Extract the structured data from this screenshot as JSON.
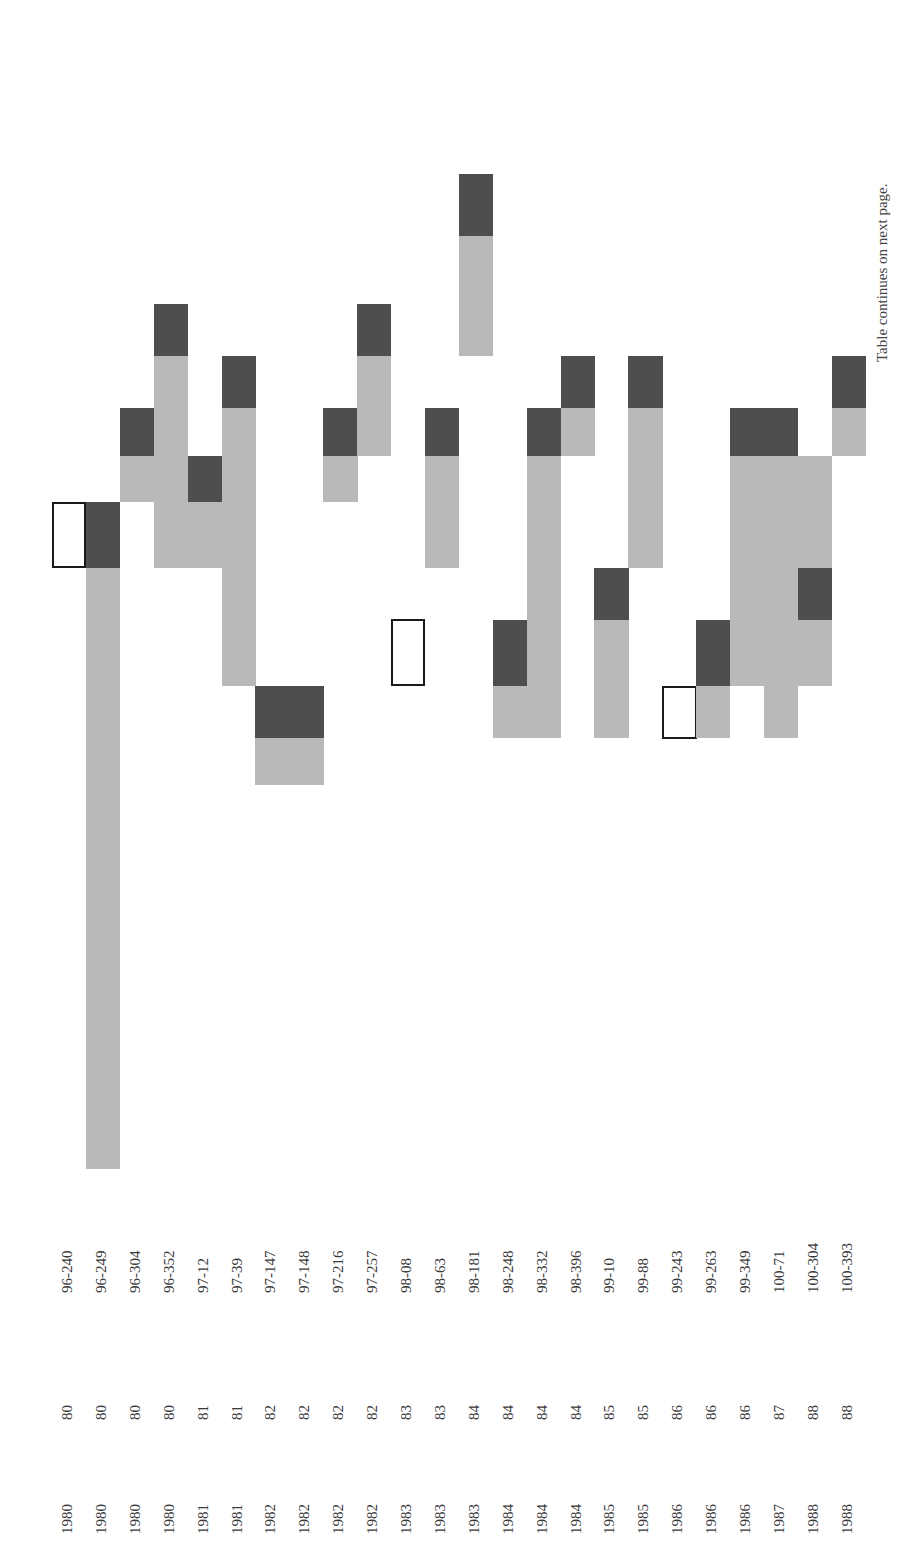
{
  "footnote": "Table continues on next page.",
  "colors": {
    "light": "#b9b9b9",
    "dark": "#4e4e4e",
    "outline": "#1a1a1a"
  },
  "rows": [
    {
      "year": "1980",
      "vol": "80",
      "cite": "96-240"
    },
    {
      "year": "1980",
      "vol": "80",
      "cite": "96-249"
    },
    {
      "year": "1980",
      "vol": "80",
      "cite": "96-304"
    },
    {
      "year": "1980",
      "vol": "80",
      "cite": "96-352"
    },
    {
      "year": "1981",
      "vol": "81",
      "cite": "97-12"
    },
    {
      "year": "1981",
      "vol": "81",
      "cite": "97-39"
    },
    {
      "year": "1982",
      "vol": "82",
      "cite": "97-147"
    },
    {
      "year": "1982",
      "vol": "82",
      "cite": "97-148"
    },
    {
      "year": "1982",
      "vol": "82",
      "cite": "97-216"
    },
    {
      "year": "1982",
      "vol": "82",
      "cite": "97-257"
    },
    {
      "year": "1983",
      "vol": "83",
      "cite": "98-08"
    },
    {
      "year": "1983",
      "vol": "83",
      "cite": "98-63"
    },
    {
      "year": "1983",
      "vol": "84",
      "cite": "98-181"
    },
    {
      "year": "1984",
      "vol": "84",
      "cite": "98-248"
    },
    {
      "year": "1984",
      "vol": "84",
      "cite": "98-332"
    },
    {
      "year": "1984",
      "vol": "84",
      "cite": "98-396"
    },
    {
      "year": "1985",
      "vol": "85",
      "cite": "99-10"
    },
    {
      "year": "1985",
      "vol": "85",
      "cite": "99-88"
    },
    {
      "year": "1986",
      "vol": "86",
      "cite": "99-243"
    },
    {
      "year": "1986",
      "vol": "86",
      "cite": "99-263"
    },
    {
      "year": "1986",
      "vol": "86",
      "cite": "99-349"
    },
    {
      "year": "1987",
      "vol": "87",
      "cite": "100-71"
    },
    {
      "year": "1988",
      "vol": "88",
      "cite": "100-304"
    },
    {
      "year": "1988",
      "vol": "88",
      "cite": "100-393"
    }
  ],
  "segments": [
    {
      "col": 0,
      "top": 502,
      "bottom": 568,
      "type": "outline"
    },
    {
      "col": 1,
      "top": 502,
      "bottom": 568,
      "type": "dark"
    },
    {
      "col": 1,
      "top": 568,
      "bottom": 1169,
      "type": "light"
    },
    {
      "col": 2,
      "top": 408,
      "bottom": 456,
      "type": "dark"
    },
    {
      "col": 2,
      "top": 456,
      "bottom": 502,
      "type": "light"
    },
    {
      "col": 3,
      "top": 304,
      "bottom": 356,
      "type": "dark"
    },
    {
      "col": 3,
      "top": 356,
      "bottom": 568,
      "type": "light"
    },
    {
      "col": 4,
      "top": 456,
      "bottom": 502,
      "type": "dark"
    },
    {
      "col": 4,
      "top": 502,
      "bottom": 568,
      "type": "light"
    },
    {
      "col": 5,
      "top": 356,
      "bottom": 408,
      "type": "dark"
    },
    {
      "col": 5,
      "top": 408,
      "bottom": 686,
      "type": "light"
    },
    {
      "col": 6,
      "top": 686,
      "bottom": 738,
      "type": "dark"
    },
    {
      "col": 6,
      "top": 738,
      "bottom": 785,
      "type": "light"
    },
    {
      "col": 7,
      "top": 686,
      "bottom": 738,
      "type": "dark"
    },
    {
      "col": 7,
      "top": 738,
      "bottom": 785,
      "type": "light"
    },
    {
      "col": 8,
      "top": 408,
      "bottom": 456,
      "type": "dark"
    },
    {
      "col": 8,
      "top": 456,
      "bottom": 502,
      "type": "light"
    },
    {
      "col": 9,
      "top": 304,
      "bottom": 356,
      "type": "dark"
    },
    {
      "col": 9,
      "top": 356,
      "bottom": 456,
      "type": "light"
    },
    {
      "col": 10,
      "top": 619,
      "bottom": 686,
      "type": "outline"
    },
    {
      "col": 11,
      "top": 408,
      "bottom": 456,
      "type": "dark"
    },
    {
      "col": 11,
      "top": 456,
      "bottom": 568,
      "type": "light"
    },
    {
      "col": 12,
      "top": 174,
      "bottom": 236,
      "type": "dark"
    },
    {
      "col": 12,
      "top": 236,
      "bottom": 356,
      "type": "light"
    },
    {
      "col": 13,
      "top": 620,
      "bottom": 686,
      "type": "dark"
    },
    {
      "col": 13,
      "top": 686,
      "bottom": 738,
      "type": "light"
    },
    {
      "col": 14,
      "top": 408,
      "bottom": 456,
      "type": "dark"
    },
    {
      "col": 14,
      "top": 456,
      "bottom": 738,
      "type": "light"
    },
    {
      "col": 15,
      "top": 356,
      "bottom": 408,
      "type": "dark"
    },
    {
      "col": 15,
      "top": 408,
      "bottom": 456,
      "type": "light"
    },
    {
      "col": 16,
      "top": 568,
      "bottom": 620,
      "type": "dark"
    },
    {
      "col": 16,
      "top": 620,
      "bottom": 738,
      "type": "light"
    },
    {
      "col": 17,
      "top": 356,
      "bottom": 408,
      "type": "dark"
    },
    {
      "col": 17,
      "top": 408,
      "bottom": 568,
      "type": "light"
    },
    {
      "col": 18,
      "top": 686,
      "bottom": 739,
      "type": "outline"
    },
    {
      "col": 19,
      "top": 620,
      "bottom": 686,
      "type": "dark"
    },
    {
      "col": 19,
      "top": 686,
      "bottom": 738,
      "type": "light"
    },
    {
      "col": 20,
      "top": 408,
      "bottom": 456,
      "type": "dark"
    },
    {
      "col": 20,
      "top": 456,
      "bottom": 686,
      "type": "light"
    },
    {
      "col": 21,
      "top": 408,
      "bottom": 456,
      "type": "dark"
    },
    {
      "col": 21,
      "top": 456,
      "bottom": 738,
      "type": "light"
    },
    {
      "col": 22,
      "top": 456,
      "bottom": 568,
      "type": "light"
    },
    {
      "col": 22,
      "top": 568,
      "bottom": 620,
      "type": "dark"
    },
    {
      "col": 22,
      "top": 620,
      "bottom": 686,
      "type": "light"
    },
    {
      "col": 23,
      "top": 356,
      "bottom": 408,
      "type": "dark"
    },
    {
      "col": 23,
      "top": 408,
      "bottom": 456,
      "type": "light"
    }
  ],
  "layout": {
    "col_x0": 52,
    "col_w": 33.9,
    "year_y": 1534,
    "vol_y": 1420,
    "cite_y": 1293
  }
}
